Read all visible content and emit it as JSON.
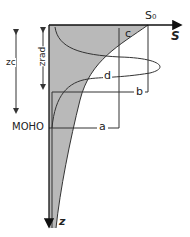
{
  "diagram": {
    "axes": {
      "x_label": "S",
      "x_max_label": "S₀",
      "y_label": "z"
    },
    "depth_markers": {
      "zc_label": "zc",
      "zrad_label": "zrad",
      "moho_label": "MOHO"
    },
    "curves": [
      {
        "label": "a"
      },
      {
        "label": "b"
      },
      {
        "label": "c"
      },
      {
        "label": "d"
      }
    ],
    "colors": {
      "fill": "#b9b9b9",
      "line": "#333333",
      "axis": "#111111"
    }
  }
}
